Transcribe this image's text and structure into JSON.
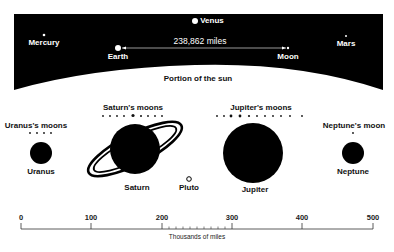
{
  "diagram": {
    "top_labels": {
      "venus": "Venus",
      "mercury": "Mercury",
      "mars": "Mars",
      "earth": "Earth",
      "moon": "Moon",
      "distance": "238,862 miles",
      "sun": "Portion of the sun"
    },
    "moons_labels": {
      "uranus": "Uranus's moons",
      "saturn": "Saturn's moons",
      "jupiter": "Jupiter's moons",
      "neptune": "Neptune's moon"
    },
    "planets": {
      "uranus": "Uranus",
      "saturn": "Saturn",
      "pluto": "Pluto",
      "jupiter": "Jupiter",
      "neptune": "Neptune"
    },
    "scale": {
      "ticks": [
        "0",
        "100",
        "200",
        "300",
        "400",
        "500"
      ],
      "title": "Thousands of miles"
    },
    "colors": {
      "background": "#ffffff",
      "space": "#000000",
      "ink": "#111111"
    }
  }
}
